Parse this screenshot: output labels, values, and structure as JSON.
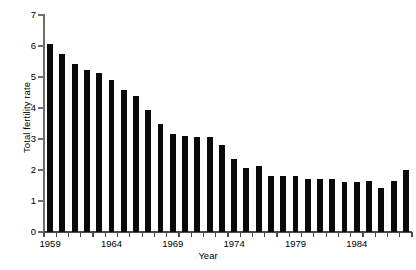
{
  "chart_data": {
    "type": "bar",
    "title": "",
    "xlabel": "Year",
    "ylabel": "Total fertility rate",
    "xlim": [
      1958.5,
      1988.5
    ],
    "ylim": [
      0,
      7
    ],
    "ytick_values": [
      0,
      1,
      2,
      3,
      4,
      5,
      6,
      7
    ],
    "ytick_labels": [
      "0",
      "1",
      "2",
      "3",
      "4",
      "5",
      "6",
      "7"
    ],
    "xtick_labels": [
      "1959",
      "1964",
      "1969",
      "1974",
      "1979",
      "1984"
    ],
    "xtick_label_values": [
      1959,
      1964,
      1969,
      1974,
      1979,
      1984
    ],
    "grid": false,
    "legend": null,
    "bar_color": "#0a0a0a",
    "axis_color": "#5a5a5a",
    "background": "#ffffff",
    "categories": [
      "1959",
      "1960",
      "1961",
      "1962",
      "1963",
      "1964",
      "1965",
      "1966",
      "1967",
      "1968",
      "1969",
      "1970",
      "1971",
      "1972",
      "1973",
      "1974",
      "1975",
      "1976",
      "1977",
      "1978",
      "1979",
      "1980",
      "1981",
      "1982",
      "1983",
      "1984",
      "1985",
      "1986",
      "1987",
      "1988"
    ],
    "values": [
      6.08,
      5.75,
      5.42,
      5.22,
      5.12,
      4.9,
      4.58,
      4.38,
      3.92,
      3.48,
      3.15,
      3.1,
      3.07,
      3.07,
      2.81,
      2.37,
      2.08,
      2.12,
      1.82,
      1.82,
      1.8,
      1.71,
      1.72,
      1.71,
      1.61,
      1.61,
      1.63,
      1.43,
      1.65,
      1.99
    ]
  }
}
